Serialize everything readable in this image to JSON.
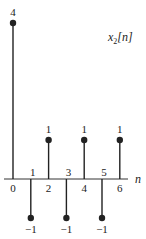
{
  "chart_data": {
    "type": "stem",
    "title": "x2[n]",
    "title_parts": {
      "base": "x",
      "sub": "2",
      "arg": "[n]"
    },
    "xlabel": "n",
    "ylabel": "",
    "x": [
      0,
      1,
      2,
      3,
      4,
      5,
      6
    ],
    "values": [
      4,
      -1,
      1,
      -1,
      1,
      -1,
      1
    ],
    "value_labels": [
      "4",
      "−1",
      "1",
      "−1",
      "1",
      "−1",
      "1"
    ],
    "tick_labels": [
      "0",
      "1",
      "2",
      "3",
      "4",
      "5",
      "6"
    ],
    "grid": false,
    "legend": null,
    "colors": {
      "stem": "#222222",
      "axis": "#333333"
    }
  }
}
